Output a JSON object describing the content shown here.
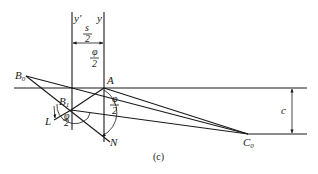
{
  "figure": {
    "caption": "(c)",
    "points": {
      "B0": {
        "label": "B",
        "sub": "0"
      },
      "B1": {
        "label": "B",
        "sub": "1"
      },
      "A": {
        "label": "A"
      },
      "L": {
        "label": "L"
      },
      "N": {
        "label": "N"
      },
      "C0": {
        "label": "C",
        "sub": "0"
      }
    },
    "axes": {
      "y_prime": "y'",
      "y": "y"
    },
    "dimensions": {
      "s_half": {
        "num": "s",
        "den": "2"
      },
      "phi_half_top": {
        "num": "φ",
        "den": "2"
      },
      "phi_half_right": {
        "num": "φ",
        "den": "2"
      },
      "phi_small": {
        "num": "φ",
        "den": "2"
      },
      "c": "c"
    }
  }
}
